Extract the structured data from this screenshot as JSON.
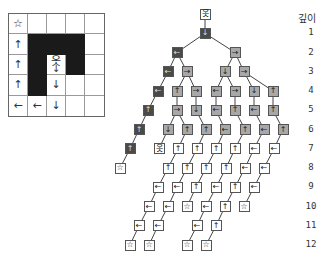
{
  "grid": {
    "rows": 5,
    "cols": 5,
    "cells": [
      [
        {
          "type": "star",
          "glyph": "☆"
        },
        {
          "type": "empty"
        },
        {
          "type": "empty"
        },
        {
          "type": "empty"
        },
        {
          "type": "empty"
        }
      ],
      [
        {
          "type": "arrow",
          "glyph": "↑"
        },
        {
          "type": "wall"
        },
        {
          "type": "wall"
        },
        {
          "type": "wall"
        },
        {
          "type": "empty"
        }
      ],
      [
        {
          "type": "arrow",
          "glyph": "↑"
        },
        {
          "type": "wall"
        },
        {
          "type": "agent",
          "glyph": "옷",
          "glyph2": "↓"
        },
        {
          "type": "wall"
        },
        {
          "type": "empty"
        }
      ],
      [
        {
          "type": "arrow",
          "glyph": "↑"
        },
        {
          "type": "wall"
        },
        {
          "type": "arrow",
          "glyph": "↓"
        },
        {
          "type": "empty"
        },
        {
          "type": "empty"
        }
      ],
      [
        {
          "type": "arrow",
          "glyph": "←"
        },
        {
          "type": "arrow",
          "glyph": "←"
        },
        {
          "type": "arrow",
          "glyph": "↓"
        },
        {
          "type": "empty"
        },
        {
          "type": "empty"
        }
      ]
    ]
  },
  "depth_axis": {
    "title": "깊이",
    "labels": [
      "1",
      "2",
      "3",
      "4",
      "5",
      "6",
      "7",
      "8",
      "9",
      "10",
      "11",
      "12"
    ]
  },
  "tree": {
    "colors": {
      "white": "#ffffff",
      "light": "#a8a8a8",
      "dark": "#4a4a4a",
      "edge": "#444444"
    },
    "nodes": [
      {
        "id": "r",
        "depth": 0,
        "x": 205,
        "shade": "white",
        "glyph": "옷"
      },
      {
        "id": "a1",
        "depth": 1,
        "x": 205,
        "shade": "dark",
        "glyph": "↓",
        "parent": "r"
      },
      {
        "id": "b1",
        "depth": 2,
        "x": 177,
        "shade": "dark",
        "glyph": "←",
        "parent": "a1"
      },
      {
        "id": "b2",
        "depth": 2,
        "x": 235,
        "shade": "light",
        "glyph": "→",
        "parent": "a1"
      },
      {
        "id": "c1",
        "depth": 3,
        "x": 168,
        "shade": "dark",
        "glyph": "←",
        "parent": "b1"
      },
      {
        "id": "c2",
        "depth": 3,
        "x": 187,
        "shade": "light",
        "glyph": "→",
        "parent": "b1"
      },
      {
        "id": "c3",
        "depth": 3,
        "x": 225,
        "shade": "light",
        "glyph": "↓",
        "parent": "b2"
      },
      {
        "id": "c4",
        "depth": 3,
        "x": 244,
        "shade": "light",
        "glyph": "→",
        "parent": "b2"
      },
      {
        "id": "d1",
        "depth": 4,
        "x": 158,
        "shade": "dark",
        "glyph": "←",
        "parent": "c1"
      },
      {
        "id": "d2",
        "depth": 4,
        "x": 177,
        "shade": "light",
        "glyph": "↑",
        "parent": "c2"
      },
      {
        "id": "d3",
        "depth": 4,
        "x": 196,
        "shade": "light",
        "glyph": "→",
        "parent": "c2"
      },
      {
        "id": "d4",
        "depth": 4,
        "x": 216,
        "shade": "light",
        "glyph": "←",
        "parent": "c3"
      },
      {
        "id": "d5",
        "depth": 4,
        "x": 235,
        "shade": "light",
        "glyph": "→",
        "parent": "c3"
      },
      {
        "id": "d6",
        "depth": 4,
        "x": 254,
        "shade": "light",
        "glyph": "↓",
        "parent": "c4"
      },
      {
        "id": "d7",
        "depth": 4,
        "x": 273,
        "shade": "light",
        "glyph": "↑",
        "parent": "c4"
      },
      {
        "id": "e1",
        "depth": 5,
        "x": 148,
        "shade": "dark",
        "glyph": "↑",
        "parent": "d1"
      },
      {
        "id": "e2",
        "depth": 5,
        "x": 177,
        "shade": "light",
        "glyph": "→",
        "parent": "d2"
      },
      {
        "id": "e3",
        "depth": 5,
        "x": 196,
        "shade": "light",
        "glyph": "↓",
        "parent": "d3"
      },
      {
        "id": "e4",
        "depth": 5,
        "x": 216,
        "shade": "light",
        "glyph": "←",
        "parent": "d4"
      },
      {
        "id": "e5",
        "depth": 5,
        "x": 235,
        "shade": "light",
        "glyph": "↑",
        "parent": "d5"
      },
      {
        "id": "e6",
        "depth": 5,
        "x": 254,
        "shade": "light",
        "glyph": "←",
        "parent": "d6"
      },
      {
        "id": "e7",
        "depth": 5,
        "x": 273,
        "shade": "light",
        "glyph": "↑",
        "parent": "d7"
      },
      {
        "id": "f1",
        "depth": 6,
        "x": 139,
        "shade": "dark",
        "glyph": "↑",
        "parent": "e1"
      },
      {
        "id": "f2",
        "depth": 6,
        "x": 168,
        "shade": "light",
        "glyph": "↓",
        "parent": "e2"
      },
      {
        "id": "f3",
        "depth": 6,
        "x": 187,
        "shade": "light",
        "glyph": "↑",
        "parent": "e2"
      },
      {
        "id": "f4",
        "depth": 6,
        "x": 206,
        "shade": "light",
        "glyph": "↑",
        "parent": "e3"
      },
      {
        "id": "f5",
        "depth": 6,
        "x": 225,
        "shade": "light",
        "glyph": "←",
        "parent": "e4"
      },
      {
        "id": "f6",
        "depth": 6,
        "x": 245,
        "shade": "light",
        "glyph": "↑",
        "parent": "e5"
      },
      {
        "id": "f7",
        "depth": 6,
        "x": 264,
        "shade": "light",
        "glyph": "←",
        "parent": "e6"
      },
      {
        "id": "f8",
        "depth": 6,
        "x": 283,
        "shade": "light",
        "glyph": "↑",
        "parent": "e7"
      },
      {
        "id": "g1",
        "depth": 7,
        "x": 130,
        "shade": "dark",
        "glyph": "↑",
        "parent": "f1"
      },
      {
        "id": "g2",
        "depth": 7,
        "x": 159,
        "shade": "white",
        "glyph": "옷",
        "parent": "f2"
      },
      {
        "id": "g3",
        "depth": 7,
        "x": 178,
        "shade": "white",
        "glyph": "↑",
        "parent": "f3"
      },
      {
        "id": "g4",
        "depth": 7,
        "x": 197,
        "shade": "white",
        "glyph": "↑",
        "parent": "f4"
      },
      {
        "id": "g5",
        "depth": 7,
        "x": 216,
        "shade": "white",
        "glyph": "↑",
        "parent": "f5"
      },
      {
        "id": "g6",
        "depth": 7,
        "x": 235,
        "shade": "white",
        "glyph": "↑",
        "parent": "f6"
      },
      {
        "id": "g7",
        "depth": 7,
        "x": 254,
        "shade": "white",
        "glyph": "←",
        "parent": "f7"
      },
      {
        "id": "g8",
        "depth": 7,
        "x": 274,
        "shade": "white",
        "glyph": "←",
        "parent": "f8"
      },
      {
        "id": "h1",
        "depth": 8,
        "x": 120,
        "shade": "white",
        "glyph": "☆",
        "parent": "g1"
      },
      {
        "id": "h2",
        "depth": 8,
        "x": 168,
        "shade": "white",
        "glyph": "↑",
        "parent": "g3"
      },
      {
        "id": "h3",
        "depth": 8,
        "x": 187,
        "shade": "white",
        "glyph": "↑",
        "parent": "g4"
      },
      {
        "id": "h4",
        "depth": 8,
        "x": 206,
        "shade": "white",
        "glyph": "↑",
        "parent": "g5"
      },
      {
        "id": "h5",
        "depth": 8,
        "x": 226,
        "shade": "white",
        "glyph": "↑",
        "parent": "g6"
      },
      {
        "id": "h6",
        "depth": 8,
        "x": 245,
        "shade": "white",
        "glyph": "←",
        "parent": "g7"
      },
      {
        "id": "h7",
        "depth": 8,
        "x": 264,
        "shade": "white",
        "glyph": "←",
        "parent": "g8"
      },
      {
        "id": "i1",
        "depth": 9,
        "x": 158,
        "shade": "white",
        "glyph": "←",
        "parent": "h2"
      },
      {
        "id": "i2",
        "depth": 9,
        "x": 177,
        "shade": "white",
        "glyph": "←",
        "parent": "h3"
      },
      {
        "id": "i3",
        "depth": 9,
        "x": 196,
        "shade": "white",
        "glyph": "↑",
        "parent": "h4"
      },
      {
        "id": "i4",
        "depth": 9,
        "x": 216,
        "shade": "white",
        "glyph": "←",
        "parent": "h5"
      },
      {
        "id": "i5",
        "depth": 9,
        "x": 235,
        "shade": "white",
        "glyph": "↑",
        "parent": "h6"
      },
      {
        "id": "i6",
        "depth": 9,
        "x": 254,
        "shade": "white",
        "glyph": "←",
        "parent": "h7"
      },
      {
        "id": "j1",
        "depth": 10,
        "x": 149,
        "shade": "white",
        "glyph": "←",
        "parent": "i1"
      },
      {
        "id": "j2",
        "depth": 10,
        "x": 168,
        "shade": "white",
        "glyph": "←",
        "parent": "i2"
      },
      {
        "id": "j3",
        "depth": 10,
        "x": 187,
        "shade": "white",
        "glyph": "☆",
        "parent": "i3"
      },
      {
        "id": "j4",
        "depth": 10,
        "x": 206,
        "shade": "white",
        "glyph": "←",
        "parent": "i4"
      },
      {
        "id": "j5",
        "depth": 10,
        "x": 225,
        "shade": "white",
        "glyph": "↑",
        "parent": "i5"
      },
      {
        "id": "j6",
        "depth": 10,
        "x": 244,
        "shade": "white",
        "glyph": "☆",
        "parent": "i6"
      },
      {
        "id": "k1",
        "depth": 11,
        "x": 139,
        "shade": "white",
        "glyph": "←",
        "parent": "j1"
      },
      {
        "id": "k2",
        "depth": 11,
        "x": 158,
        "shade": "white",
        "glyph": "←",
        "parent": "j2"
      },
      {
        "id": "k3",
        "depth": 11,
        "x": 197,
        "shade": "white",
        "glyph": "←",
        "parent": "j4"
      },
      {
        "id": "k4",
        "depth": 11,
        "x": 216,
        "shade": "white",
        "glyph": "↑",
        "parent": "j5"
      },
      {
        "id": "l1",
        "depth": 12,
        "x": 130,
        "shade": "white",
        "glyph": "☆",
        "parent": "k1"
      },
      {
        "id": "l2",
        "depth": 12,
        "x": 149,
        "shade": "white",
        "glyph": "☆",
        "parent": "k2"
      },
      {
        "id": "l3",
        "depth": 12,
        "x": 187,
        "shade": "white",
        "glyph": "☆",
        "parent": "k3"
      },
      {
        "id": "l4",
        "depth": 12,
        "x": 206,
        "shade": "white",
        "glyph": "☆",
        "parent": "k4"
      }
    ]
  }
}
